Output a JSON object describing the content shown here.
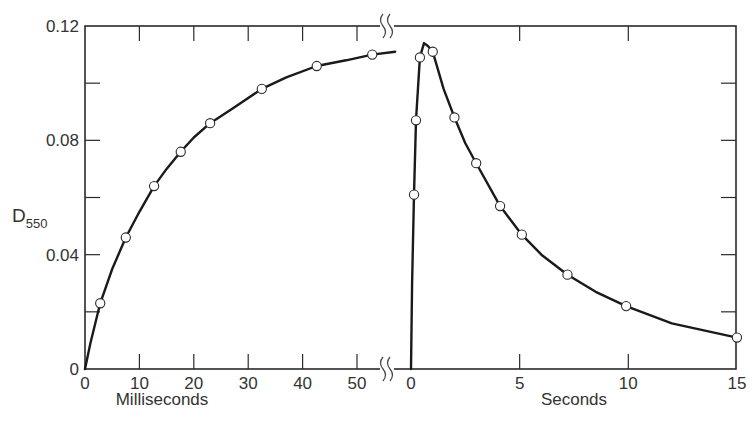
{
  "chart_data": {
    "type": "line",
    "title": "",
    "ylabel": "D",
    "ylabel_subscript": "550",
    "ylim": [
      0,
      0.12
    ],
    "yticks": [
      0,
      0.04,
      0.08,
      0.12
    ],
    "ytick_labels": [
      "0",
      "0.04",
      "0.08",
      "0.12"
    ],
    "yminor_step": 0.02,
    "grid": false,
    "legend": null,
    "segments": [
      {
        "name": "milliseconds-segment",
        "xlabel": "Milliseconds",
        "xlim": [
          0,
          57
        ],
        "xticks": [
          0,
          10,
          20,
          30,
          40,
          50
        ],
        "xtick_labels": [
          "0",
          "10",
          "20",
          "30",
          "40",
          "50"
        ],
        "points": [
          {
            "x": 2.8,
            "y": 0.023
          },
          {
            "x": 7.5,
            "y": 0.046
          },
          {
            "x": 12.7,
            "y": 0.064
          },
          {
            "x": 17.6,
            "y": 0.076
          },
          {
            "x": 23.0,
            "y": 0.086
          },
          {
            "x": 32.5,
            "y": 0.098
          },
          {
            "x": 42.6,
            "y": 0.106
          },
          {
            "x": 52.8,
            "y": 0.11
          }
        ],
        "curve": [
          [
            0,
            0
          ],
          [
            1,
            0.009
          ],
          [
            2.8,
            0.023
          ],
          [
            5,
            0.035
          ],
          [
            7.5,
            0.046
          ],
          [
            10,
            0.055
          ],
          [
            12.7,
            0.064
          ],
          [
            15,
            0.07
          ],
          [
            17.6,
            0.076
          ],
          [
            20,
            0.081
          ],
          [
            23,
            0.086
          ],
          [
            27,
            0.091
          ],
          [
            32.5,
            0.098
          ],
          [
            37,
            0.102
          ],
          [
            42.6,
            0.106
          ],
          [
            48,
            0.108
          ],
          [
            52.8,
            0.11
          ],
          [
            57,
            0.111
          ]
        ]
      },
      {
        "name": "seconds-segment",
        "xlabel": "Seconds",
        "xlim": [
          0,
          15
        ],
        "xticks": [
          0,
          5,
          10,
          15
        ],
        "xtick_labels": [
          "0",
          "5",
          "10",
          "15"
        ],
        "points": [
          {
            "x": 0.14,
            "y": 0.061
          },
          {
            "x": 0.23,
            "y": 0.087
          },
          {
            "x": 0.41,
            "y": 0.109
          },
          {
            "x": 1.0,
            "y": 0.111
          },
          {
            "x": 2.0,
            "y": 0.088
          },
          {
            "x": 3.0,
            "y": 0.072
          },
          {
            "x": 4.1,
            "y": 0.057
          },
          {
            "x": 5.1,
            "y": 0.047
          },
          {
            "x": 7.2,
            "y": 0.033
          },
          {
            "x": 9.9,
            "y": 0.022
          },
          {
            "x": 15.0,
            "y": 0.011
          }
        ],
        "curve": [
          [
            0.0,
            0.0
          ],
          [
            0.05,
            0.03
          ],
          [
            0.14,
            0.061
          ],
          [
            0.23,
            0.087
          ],
          [
            0.41,
            0.109
          ],
          [
            0.6,
            0.114
          ],
          [
            0.78,
            0.113
          ],
          [
            1.0,
            0.111
          ],
          [
            1.5,
            0.098
          ],
          [
            2.0,
            0.088
          ],
          [
            2.5,
            0.079
          ],
          [
            3.0,
            0.072
          ],
          [
            4.1,
            0.057
          ],
          [
            5.1,
            0.047
          ],
          [
            6,
            0.04
          ],
          [
            7.2,
            0.033
          ],
          [
            8.5,
            0.027
          ],
          [
            9.9,
            0.022
          ],
          [
            12,
            0.016
          ],
          [
            15.0,
            0.011
          ]
        ]
      }
    ]
  }
}
